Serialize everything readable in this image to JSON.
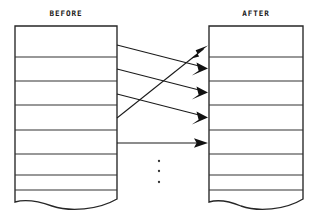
{
  "diagram": {
    "title_left": "BEFORE",
    "title_right": "AFTER",
    "background_color": "#ffffff",
    "line_color": "#262626",
    "arrow_color": "#111111"
  },
  "labels": {
    "before": {
      "text": "BEFORE",
      "x": 66,
      "y": 14
    },
    "after": {
      "text": "AFTER",
      "x": 256,
      "y": 14
    }
  },
  "boxes": {
    "before_box": {
      "name": "BEFORE",
      "left": 15,
      "right": 117,
      "top": 26,
      "bottom": 205,
      "row_dividers_y": [
        57,
        81,
        105,
        130,
        154,
        175,
        190
      ],
      "row_count": 8,
      "bottom_edge_style": "wavy"
    },
    "after_box": {
      "name": "AFTER",
      "left": 209,
      "right": 303,
      "top": 26,
      "bottom": 205,
      "row_dividers_y": [
        57,
        81,
        105,
        130,
        154,
        175,
        190
      ],
      "row_count": 8,
      "bottom_edge_style": "wavy"
    }
  },
  "connectors": [
    {
      "id": "arrow-1",
      "from_row": 1,
      "to_row": 2,
      "x1": 117,
      "y1": 45,
      "x2": 207,
      "y2": 68
    },
    {
      "id": "arrow-2",
      "from_row": 2,
      "to_row": 3,
      "x1": 117,
      "y1": 69,
      "x2": 207,
      "y2": 92
    },
    {
      "id": "arrow-3",
      "from_row": 3,
      "to_row": 4,
      "x1": 117,
      "y1": 94,
      "x2": 207,
      "y2": 117
    },
    {
      "id": "arrow-4",
      "from_row": 4,
      "to_row": 1,
      "x1": 117,
      "y1": 118,
      "x2": 207,
      "y2": 46
    },
    {
      "id": "arrow-5",
      "from_row": 5,
      "to_row": 5,
      "x1": 117,
      "y1": 143,
      "x2": 207,
      "y2": 143
    }
  ],
  "ellipsis": {
    "x": 159,
    "dots_y": [
      161,
      171,
      182
    ],
    "radius": 1.1,
    "count": 3
  }
}
